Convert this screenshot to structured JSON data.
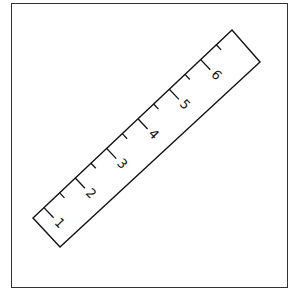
{
  "figure": {
    "ruler": {
      "labels": [
        "1",
        "2",
        "3",
        "4",
        "5",
        "6"
      ],
      "minor_ticks_per_unit": 1,
      "stroke_color": "#111111",
      "background": "#ffffff"
    },
    "frame_color": "#333333"
  }
}
